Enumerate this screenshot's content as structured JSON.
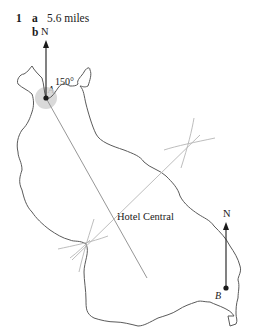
{
  "question": {
    "number": "1",
    "part_a": {
      "label": "a",
      "answer": "5.6 miles"
    },
    "part_b": {
      "label": "b"
    }
  },
  "map": {
    "north_label_a": "N",
    "north_label_b": "N",
    "point_a": "A",
    "point_b": "B",
    "bearing_angle": "150°",
    "landmark": "Hotel Central"
  },
  "colors": {
    "ink": "#1a1a1a",
    "coast": "#555555",
    "construction": "#b5b5b5",
    "bearing_line": "#8a8a8a",
    "angle_fill": "#cfcfcf"
  }
}
